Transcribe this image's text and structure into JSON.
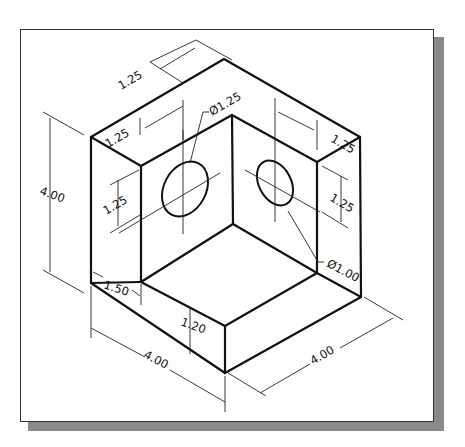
{
  "drawing": {
    "type": "isometric-technical-drawing",
    "subject": "L-shaped block with two holes",
    "frame": {
      "border_color": "#333333",
      "shadow_color": "#8a8a8a",
      "background": "#ffffff"
    },
    "dimensions": {
      "top_back_depth": "1.25",
      "left_wall_thickness": "1.25",
      "right_wall_thickness": "1.25",
      "left_hole_diameter": "Ø1.25",
      "right_hole_diameter": "Ø1.00",
      "left_hole_height": "1.25",
      "right_hole_height": "1.25",
      "overall_height": "4.00",
      "step_width": "1.50",
      "step_height": "1.20",
      "front_width": "4.00",
      "right_width": "4.00"
    }
  }
}
